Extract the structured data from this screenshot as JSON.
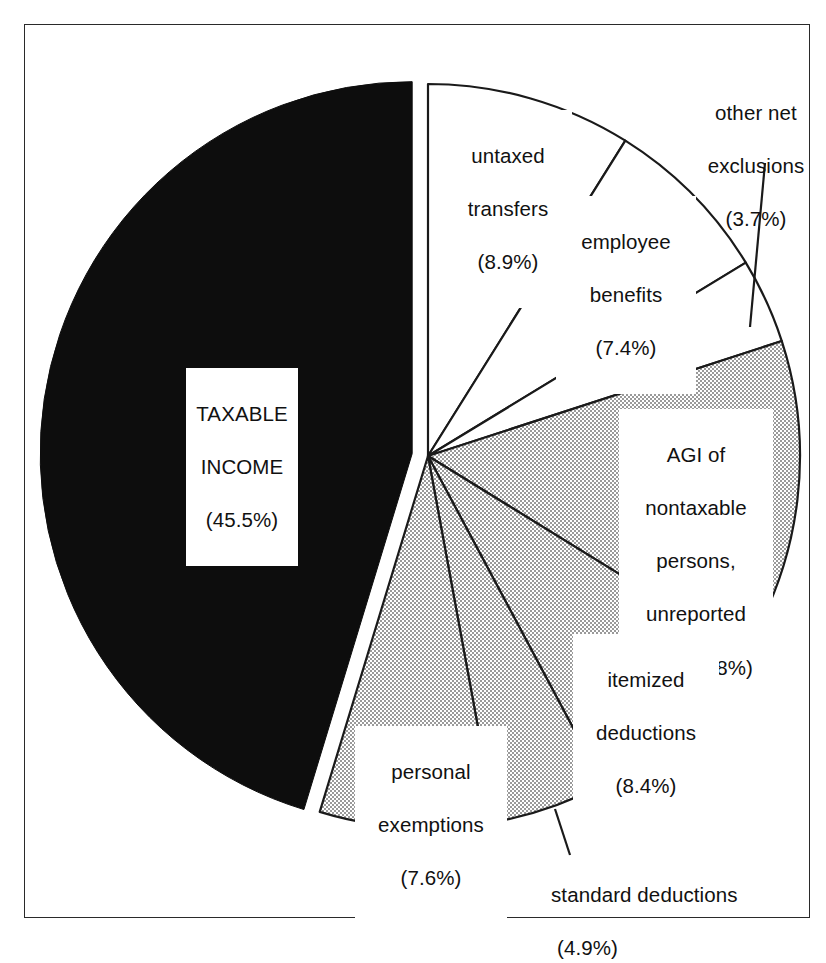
{
  "figure": {
    "border_color": "#2a2a2a",
    "background": "#ffffff"
  },
  "chart_data": {
    "type": "pie",
    "title": "",
    "subtitle": "",
    "xlabel": "",
    "ylabel": "",
    "legend_position": "none",
    "grid": false,
    "units": "percent of total personal income",
    "start_angle_deg": 0,
    "direction": "clockwise",
    "exploded_slices": [
      "TAXABLE INCOME"
    ],
    "categories": [
      "untaxed transfers",
      "employee benefits",
      "other net exclusions",
      "AGI of nontaxable persons, unreported AGI",
      "itemized deductions",
      "standard deductions",
      "personal exemptions",
      "TAXABLE INCOME"
    ],
    "values": [
      8.9,
      7.4,
      3.7,
      13.8,
      8.4,
      4.9,
      7.6,
      45.5
    ],
    "slices": [
      {
        "name": "untaxed-transfers",
        "label": "untaxed\ntransfers",
        "value_label": "(8.9%)",
        "value": 8.9,
        "fill": "white",
        "fill_color": "#ffffff",
        "start_deg": 0.0,
        "end_deg": 32.04,
        "exploded": false,
        "leader_line": false
      },
      {
        "name": "employee-benefits",
        "label": "employee\nbenefits",
        "value_label": "(7.4%)",
        "value": 7.4,
        "fill": "white",
        "fill_color": "#ffffff",
        "start_deg": 32.04,
        "end_deg": 58.68,
        "exploded": false,
        "leader_line": false
      },
      {
        "name": "other-net-exclusions",
        "label": "other net\nexclusions",
        "value_label": "(3.7%)",
        "value": 3.7,
        "fill": "white",
        "fill_color": "#ffffff",
        "start_deg": 58.68,
        "end_deg": 72.0,
        "exploded": false,
        "leader_line": true
      },
      {
        "name": "agi-nontaxable-unreported",
        "label": "AGI of\nnontaxable\npersons,\nunreported",
        "value_label": "AGI  (13.8%)",
        "value": 13.8,
        "fill": "stipple",
        "fill_color": "#d9d9d9",
        "start_deg": 72.0,
        "end_deg": 121.68,
        "exploded": false,
        "leader_line": false
      },
      {
        "name": "itemized-deductions",
        "label": "itemized\ndeductions",
        "value_label": "(8.4%)",
        "value": 8.4,
        "fill": "stipple",
        "fill_color": "#d9d9d9",
        "start_deg": 121.68,
        "end_deg": 151.92,
        "exploded": false,
        "leader_line": false
      },
      {
        "name": "standard-deductions",
        "label": "standard deductions",
        "value_label": "(4.9%)",
        "value": 4.9,
        "fill": "stipple",
        "fill_color": "#d9d9d9",
        "start_deg": 151.92,
        "end_deg": 169.56,
        "exploded": false,
        "leader_line": true
      },
      {
        "name": "personal-exemptions",
        "label": "personal\nexemptions",
        "value_label": "(7.6%)",
        "value": 7.6,
        "fill": "stipple",
        "fill_color": "#d9d9d9",
        "start_deg": 169.56,
        "end_deg": 196.92,
        "exploded": false,
        "leader_line": false
      },
      {
        "name": "taxable-income",
        "label": "TAXABLE\nINCOME",
        "value_label": "(45.5%)",
        "value": 45.5,
        "fill": "solid-black",
        "fill_color": "#0d0d0d",
        "start_deg": 196.92,
        "end_deg": 360.0,
        "exploded": true,
        "leader_line": false
      }
    ]
  },
  "labels": {
    "untaxed_transfers": {
      "line1": "untaxed",
      "line2": "transfers",
      "line3": "(8.9%)"
    },
    "employee_benefits": {
      "line1": "employee",
      "line2": "benefits",
      "line3": "(7.4%)"
    },
    "other_net_exclusions": {
      "line1": "other net",
      "line2": "exclusions",
      "line3": "(3.7%)"
    },
    "agi_nontaxable": {
      "line1": "AGI of",
      "line2": "nontaxable",
      "line3": "persons,",
      "line4": "unreported",
      "line5": "AGI  (13.8%)"
    },
    "itemized_deductions": {
      "line1": "itemized",
      "line2": "deductions",
      "line3": "(8.4%)"
    },
    "standard_deductions": {
      "line1": "standard deductions",
      "line2": "(4.9%)"
    },
    "personal_exemptions": {
      "line1": "personal",
      "line2": "exemptions",
      "line3": "(7.6%)"
    },
    "taxable_income": {
      "line1": "TAXABLE",
      "line2": "INCOME",
      "line3": "(45.5%)"
    }
  }
}
